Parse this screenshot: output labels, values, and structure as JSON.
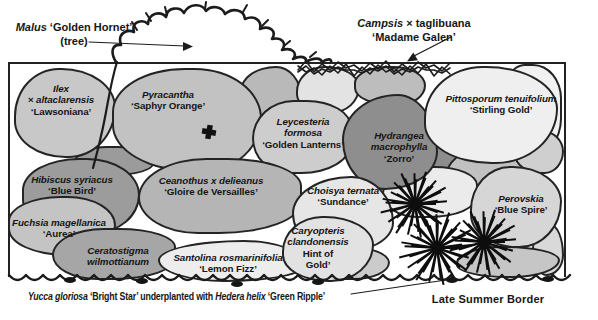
{
  "page": {
    "background": "#ffffff",
    "ink": "#1c1c1c"
  },
  "bed": {
    "fill": "#b1b1b1",
    "outline": "#232323"
  },
  "top_labels": {
    "malus": {
      "line1": [
        {
          "t": "Malus ",
          "i": 1
        },
        {
          "t": "‘Golden Hornet’",
          "i": 0
        }
      ],
      "line2": [
        {
          "t": "(tree)",
          "i": 0
        }
      ]
    },
    "campsis": {
      "line1": [
        {
          "t": "Campsis ",
          "i": 1
        },
        {
          "t": "× taglibuana",
          "i": 0
        }
      ],
      "line2": [
        {
          "t": "‘Madame Galen’",
          "i": 0
        }
      ]
    }
  },
  "plants": [
    {
      "id": "ilex",
      "blob": {
        "x": 14,
        "y": 68,
        "w": 102,
        "h": 90,
        "fill": "#c8c8c8"
      },
      "label": {
        "x": 61,
        "y": 100,
        "lines": [
          {
            "t": "Ilex",
            "i": 1
          },
          {
            "t": "× altaclarensis",
            "i": 1
          },
          {
            "t": "‘Lawsoniana’",
            "i": 0
          }
        ]
      }
    },
    {
      "id": "pyracantha",
      "blob": {
        "x": 112,
        "y": 68,
        "w": 150,
        "h": 104,
        "fill": "#c2c2c2"
      },
      "label": {
        "x": 168,
        "y": 100,
        "lines": [
          {
            "t": "Pyracantha",
            "i": 1
          },
          {
            "t": "‘Saphyr Orange’",
            "i": 0
          }
        ]
      }
    },
    {
      "id": "leycesteria",
      "blob": {
        "x": 252,
        "y": 100,
        "w": 100,
        "h": 74,
        "fill": "#cdcdcd"
      },
      "label": {
        "x": 303,
        "y": 133,
        "lines": [
          {
            "t": "Leycesteria",
            "i": 1
          },
          {
            "t": "formosa",
            "i": 1
          },
          {
            "t": "‘Golden Lanterns’",
            "i": 0
          }
        ]
      }
    },
    {
      "id": "hydrangea",
      "blob": {
        "x": 342,
        "y": 94,
        "w": 96,
        "h": 96,
        "fill": "#8e8e8e"
      },
      "label": {
        "x": 399,
        "y": 147,
        "lines": [
          {
            "t": "Hydrangea",
            "i": 1
          },
          {
            "t": "macrophylla",
            "i": 1
          },
          {
            "t": "‘Zorro’",
            "i": 0
          }
        ]
      }
    },
    {
      "id": "pittosporum",
      "blob": {
        "x": 424,
        "y": 66,
        "w": 134,
        "h": 98,
        "fill": "#efefef"
      },
      "label": {
        "x": 501,
        "y": 104,
        "lines": [
          {
            "t": "Pittosporum tenuifolium",
            "i": 1
          },
          {
            "t": "‘Stirling Gold’",
            "i": 0
          }
        ]
      }
    },
    {
      "id": "hibiscus",
      "blob": {
        "x": 22,
        "y": 158,
        "w": 118,
        "h": 76,
        "fill": "#9c9c9c"
      },
      "label": {
        "x": 72,
        "y": 185,
        "lines": [
          {
            "t": "Hibiscus syriacus",
            "i": 1
          },
          {
            "t": "‘Blue Bird’",
            "i": 0
          }
        ]
      }
    },
    {
      "id": "ceanothus",
      "blob": {
        "x": 138,
        "y": 158,
        "w": 164,
        "h": 76,
        "fill": "#b5b5b5"
      },
      "label": {
        "x": 211,
        "y": 186,
        "lines": [
          {
            "t": "Ceanothus x delieanus",
            "i": 1
          },
          {
            "t": "‘Gloire de Versailles’",
            "i": 0
          }
        ]
      }
    },
    {
      "id": "choisya",
      "blob": {
        "x": 292,
        "y": 176,
        "w": 102,
        "h": 78,
        "fill": "#e6e6e6"
      },
      "label": {
        "x": 343,
        "y": 196,
        "lines": [
          {
            "t": "Choisya ternata",
            "i": 1
          },
          {
            "t": "‘Sundance’",
            "i": 0
          }
        ]
      }
    },
    {
      "id": "perovskia",
      "blob": {
        "x": 470,
        "y": 166,
        "w": 92,
        "h": 82,
        "fill": "#d6d6d6"
      },
      "label": {
        "x": 521,
        "y": 204,
        "lines": [
          {
            "t": "Perovskia",
            "i": 1
          },
          {
            "t": "‘Blue Spire’",
            "i": 0
          }
        ]
      }
    },
    {
      "id": "fuchsia",
      "blob": {
        "x": 8,
        "y": 196,
        "w": 108,
        "h": 60,
        "fill": "#c4c4c4"
      },
      "label": {
        "x": 59,
        "y": 228,
        "lines": [
          {
            "t": "Fuchsia magellanica",
            "i": 1
          },
          {
            "t": "‘Aurea’",
            "i": 0
          }
        ]
      }
    },
    {
      "id": "ceratostigma",
      "blob": {
        "x": 52,
        "y": 228,
        "w": 124,
        "h": 52,
        "fill": "#a6a6a6"
      },
      "label": {
        "x": 118,
        "y": 256,
        "lines": [
          {
            "t": "Ceratostigma",
            "i": 1
          },
          {
            "t": "wilmottianum",
            "i": 1
          }
        ]
      }
    },
    {
      "id": "santolina",
      "blob": {
        "x": 158,
        "y": 240,
        "w": 148,
        "h": 42,
        "fill": "#ededed"
      },
      "label": {
        "x": 228,
        "y": 263,
        "lines": [
          {
            "t": "Santolina rosmarinifolia",
            "i": 1
          },
          {
            "t": "‘Lemon Fizz’",
            "i": 0
          }
        ]
      }
    },
    {
      "id": "caryopteris",
      "blob": {
        "x": 282,
        "y": 216,
        "w": 92,
        "h": 66,
        "fill": "#e2e2e2"
      },
      "label": {
        "x": 318,
        "y": 248,
        "lines": [
          {
            "t": "Caryopteris",
            "i": 1
          },
          {
            "t": "clandonensis",
            "i": 1
          },
          {
            "t": "Hint of",
            "i": 0
          },
          {
            "t": "Gold’",
            "i": 0
          }
        ]
      }
    }
  ],
  "background_blobs": [
    {
      "x": 240,
      "y": 66,
      "w": 62,
      "h": 52,
      "fill": "#b9b9b9"
    },
    {
      "x": 296,
      "y": 66,
      "w": 64,
      "h": 48,
      "fill": "#e3e3e3"
    },
    {
      "x": 354,
      "y": 66,
      "w": 72,
      "h": 40,
      "fill": "#bdbdbd"
    },
    {
      "x": 498,
      "y": 64,
      "w": 64,
      "h": 94,
      "fill": "#f1f1f1"
    },
    {
      "x": 424,
      "y": 118,
      "w": 50,
      "h": 66,
      "fill": "#8d8d8d"
    },
    {
      "x": 444,
      "y": 148,
      "w": 86,
      "h": 60,
      "fill": "#c1c1c1"
    },
    {
      "x": 514,
      "y": 130,
      "w": 50,
      "h": 44,
      "fill": "#cfcfcf"
    },
    {
      "x": 382,
      "y": 166,
      "w": 96,
      "h": 52,
      "fill": "#ebebeb"
    },
    {
      "x": 532,
      "y": 224,
      "w": 32,
      "h": 52,
      "fill": "#d9d9d9"
    },
    {
      "x": 456,
      "y": 246,
      "w": 104,
      "h": 32,
      "fill": "#c6c6c6"
    },
    {
      "x": 296,
      "y": 246,
      "w": 94,
      "h": 34,
      "fill": "#cbcbcb"
    },
    {
      "x": 74,
      "y": 146,
      "w": 80,
      "h": 30,
      "fill": "#9b9b9b"
    }
  ],
  "yucca_bursts": [
    [
      415,
      204,
      30
    ],
    [
      437,
      248,
      33
    ],
    [
      484,
      242,
      30
    ]
  ],
  "cross_marker": {
    "x": 209,
    "y": 132
  },
  "footer": {
    "caption": [
      {
        "t": "Yucca gloriosa ",
        "i": 1
      },
      {
        "t": "‘Bright Star’ underplanted with ",
        "i": 0
      },
      {
        "t": "Hedera helix ",
        "i": 1
      },
      {
        "t": "‘Green Ripple’",
        "i": 0
      }
    ],
    "title": "Late Summer Border"
  }
}
